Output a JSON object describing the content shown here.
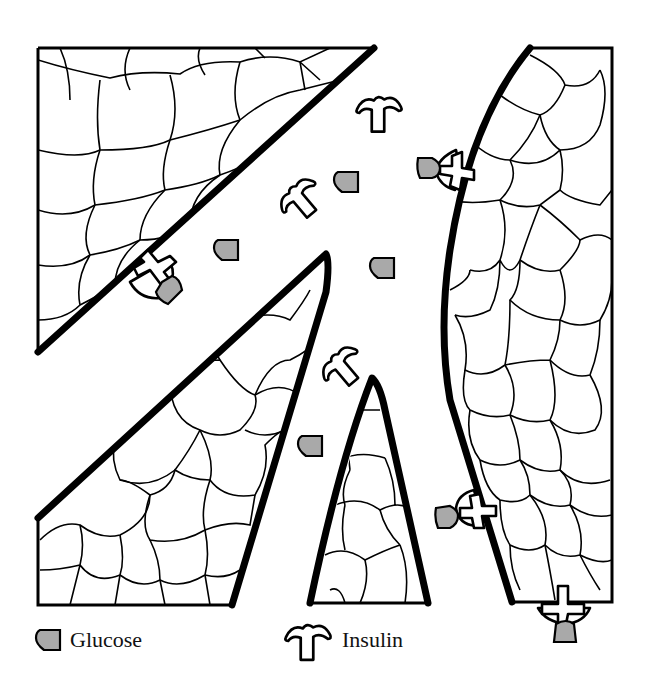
{
  "diagram": {
    "title": "",
    "colors": {
      "background": "#ffffff",
      "outline": "#000000",
      "glucose_fill": "#a9a9a9",
      "insulin_fill": "#ffffff"
    },
    "regions": [
      {
        "id": "tissue-top-left",
        "shape": "triangle"
      },
      {
        "id": "tissue-middle-left",
        "shape": "triangle"
      },
      {
        "id": "tissue-center-spike",
        "shape": "narrow-triangle"
      },
      {
        "id": "tissue-right",
        "shape": "curved-slab"
      }
    ],
    "free_molecules": {
      "insulin_count": 3,
      "glucose_count": 5
    },
    "receptor_bindings": 4
  },
  "legend": {
    "items": [
      {
        "icon": "glucose-icon",
        "label": "Glucose"
      },
      {
        "icon": "insulin-icon",
        "label": "Insulin"
      }
    ]
  }
}
